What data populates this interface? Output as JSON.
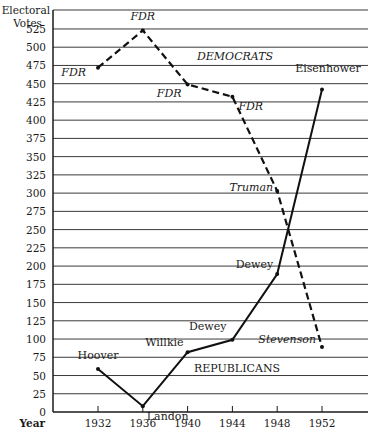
{
  "chart_data": {
    "type": "line",
    "title": "",
    "xlabel": "Year",
    "ylabel": "Electoral Votes",
    "ylabel_lines": [
      "Electoral",
      "Votes"
    ],
    "x": [
      1932,
      1936,
      1940,
      1944,
      1948,
      1952
    ],
    "x_tick_labels": [
      "1932",
      "1936",
      "1940",
      "1944",
      "1948",
      "1952"
    ],
    "y_ticks": [
      0,
      25,
      50,
      75,
      100,
      125,
      150,
      175,
      200,
      225,
      250,
      275,
      300,
      325,
      350,
      375,
      400,
      425,
      450,
      475,
      500,
      525
    ],
    "ylim": [
      0,
      550
    ],
    "grid": true,
    "series": [
      {
        "name": "DEMOCRATS",
        "style": "dashed",
        "values": [
          472,
          523,
          449,
          432,
          303,
          89
        ],
        "point_labels": [
          "FDR",
          "FDR",
          "FDR",
          "FDR",
          "Truman",
          "Stevenson"
        ]
      },
      {
        "name": "REPUBLICANS",
        "style": "solid",
        "values": [
          59,
          8,
          82,
          99,
          189,
          442
        ],
        "point_labels": [
          "Hoover",
          "Landon",
          "Willkie",
          "Dewey",
          "Dewey",
          "Eisenhower"
        ]
      }
    ],
    "annotations": [
      "DEMOCRATS",
      "REPUBLICANS"
    ]
  },
  "colors": {
    "ink": "#1a1a1a",
    "grid": "#3a3a3a",
    "background": "#ffffff"
  }
}
